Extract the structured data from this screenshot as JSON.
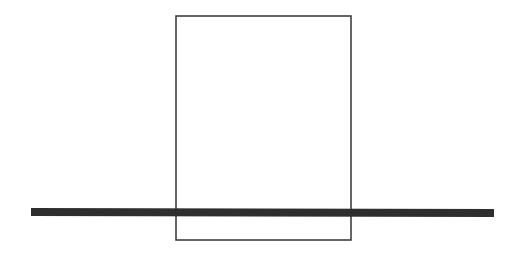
{
  "diagram": {
    "canvas": {
      "width": 521,
      "height": 260,
      "background": "#ffffff"
    },
    "rectangle": {
      "x": 176,
      "y": 16,
      "width": 175,
      "height": 224,
      "stroke": "#333333",
      "stroke_width": 1.5,
      "fill": "none"
    },
    "bar": {
      "x1": 31,
      "y1": 212,
      "x2": 494,
      "y2": 213,
      "stroke": "#2e2e2e",
      "stroke_width": 8
    }
  }
}
